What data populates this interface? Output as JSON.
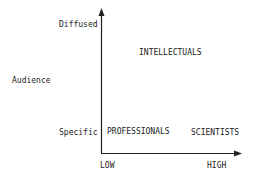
{
  "diagram": {
    "y_axis": {
      "title": "Audience",
      "top_label": "Diffused",
      "bottom_label": "Specific"
    },
    "x_axis": {
      "low_label": "LOW",
      "high_label": "HIGH"
    },
    "quadrant_labels": {
      "top_right": "INTELLECTUALS",
      "bottom_left": "PROFESSIONALS",
      "bottom_right": "SCIENTISTS"
    },
    "colors": {
      "line": "#222222",
      "text": "#222222",
      "background": "#ffffff"
    }
  }
}
